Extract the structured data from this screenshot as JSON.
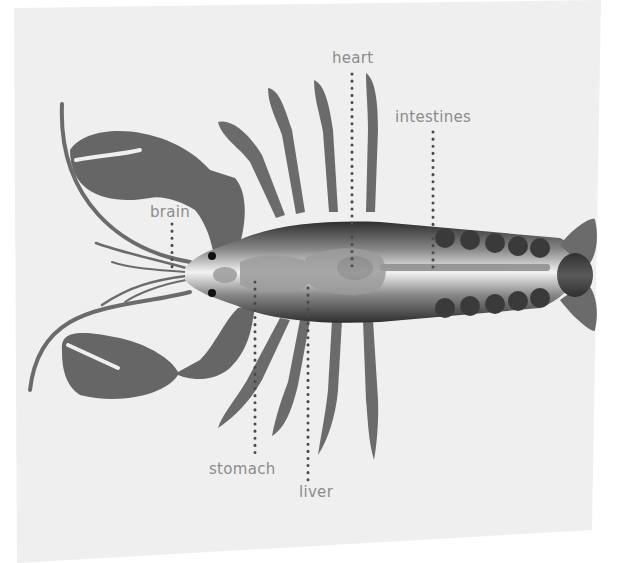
{
  "diagram": {
    "colors": {
      "sheet": "#efefef",
      "body_dark": "#3d3d3d",
      "limb": "#6b6b6b",
      "organ": "#9a9a9a",
      "label": "#8c8c8c",
      "leader_dots": "#4a4a4a"
    },
    "labels": [
      {
        "id": "brain",
        "text": "brain"
      },
      {
        "id": "heart",
        "text": "heart"
      },
      {
        "id": "intestines",
        "text": "intestines"
      },
      {
        "id": "stomach",
        "text": "stomach"
      },
      {
        "id": "liver",
        "text": "liver"
      }
    ]
  }
}
